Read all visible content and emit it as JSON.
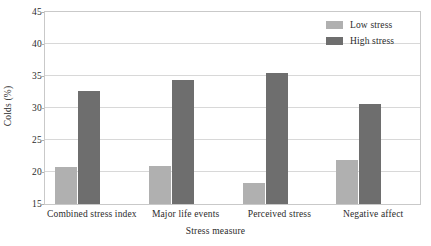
{
  "chart_data": {
    "type": "bar",
    "title": "",
    "xlabel": "Stress measure",
    "ylabel": "Colds (%)",
    "categories": [
      "Combined stress index",
      "Major life events",
      "Perceived stress",
      "Negative affect"
    ],
    "series": [
      {
        "name": "Low stress",
        "color": "#b0b0b0",
        "values": [
          20.8,
          21.0,
          18.3,
          21.9
        ]
      },
      {
        "name": "High stress",
        "color": "#6e6e6e",
        "values": [
          32.7,
          34.3,
          35.5,
          30.7
        ]
      }
    ],
    "ylim": [
      15,
      45
    ],
    "yticks": [
      15,
      20,
      25,
      30,
      35,
      40,
      45
    ],
    "ytick_labels": [
      "15",
      "20",
      "25",
      "30",
      "35",
      "40",
      "45"
    ],
    "grid": "horizontal",
    "legend_position": "top-right"
  },
  "legend": {
    "entries": [
      {
        "label": "Low stress"
      },
      {
        "label": "High stress"
      }
    ]
  },
  "axes": {
    "y_title": "Colds (%)",
    "x_title": "Stress measure"
  },
  "colors": {
    "low_stress": "#b0b0b0",
    "high_stress": "#6e6e6e",
    "grid": "#d8d8d8",
    "frame": "#c9c9c9",
    "text": "#2b2b2b",
    "background": "#ffffff"
  }
}
